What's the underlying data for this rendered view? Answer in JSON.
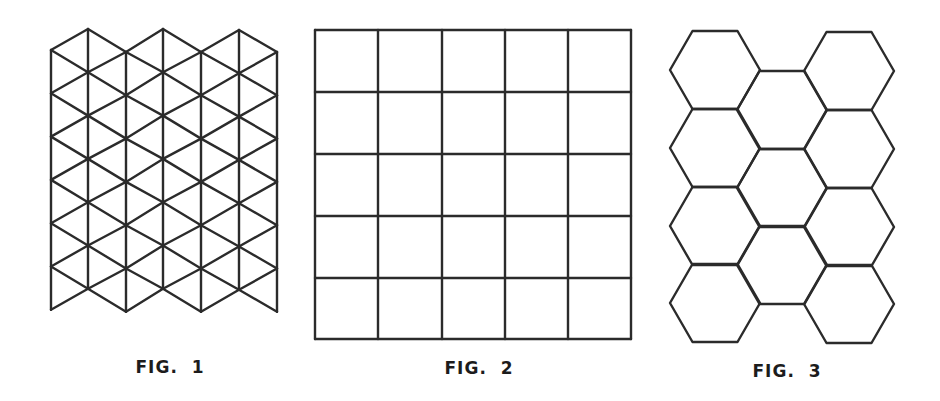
{
  "style": {
    "line_color": "#2b2b2b",
    "background": "#ffffff",
    "label_color": "#1c1c1c"
  },
  "figures": [
    {
      "id": "fig1",
      "label": "FIG.  1",
      "pattern": "triangular-grid",
      "description": "Isometric triangular lattice: 7 vertical lines with crossing diagonals, zig-zag top and bottom edges",
      "vertical_lines_x": [
        51,
        88,
        126,
        163,
        201,
        239,
        277
      ],
      "column_top_y": [
        50,
        29,
        52,
        29,
        52,
        30,
        52
      ],
      "rows": 6,
      "row_step": 43.3,
      "label_center": [
        170,
        367
      ]
    },
    {
      "id": "fig2",
      "label": "FIG.  2",
      "pattern": "square-grid",
      "description": "5 x 5 grid of squares",
      "columns": 5,
      "rows": 5,
      "x_lines": [
        315,
        378,
        442,
        505,
        568,
        631
      ],
      "y_lines": [
        30,
        92,
        154,
        216,
        278,
        339
      ],
      "label_center": [
        479,
        368
      ]
    },
    {
      "id": "fig3",
      "label": "FIG.  3",
      "pattern": "hexagonal-tiling",
      "description": "Flat-top hexagons in three columns: 4 left, 3 middle (offset), 4 right",
      "hex_radius": 45,
      "columns": [
        {
          "cx": 715,
          "cy": [
            70,
            148,
            226,
            303
          ]
        },
        {
          "cx": 782,
          "cy": [
            110,
            188,
            265
          ]
        },
        {
          "cx": 849,
          "cy": [
            71,
            149,
            227,
            304
          ]
        }
      ],
      "label_center": [
        787,
        371
      ]
    }
  ]
}
